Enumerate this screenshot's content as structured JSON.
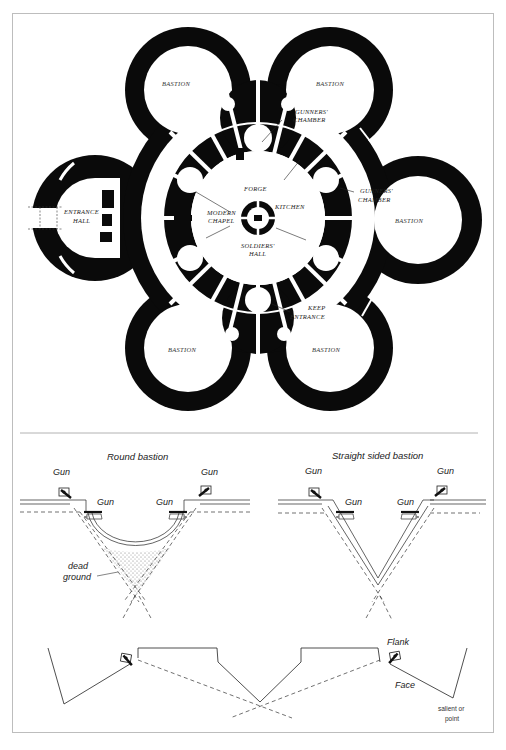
{
  "plan": {
    "labels": {
      "bastion_top_left": "BASTION",
      "bastion_top_right": "BASTION",
      "bastion_right": "BASTION",
      "bastion_bottom_left": "BASTION",
      "bastion_bottom_right": "BASTION",
      "gunners_chamber_top_1": "GUNNERS'",
      "gunners_chamber_top_2": "CHAMBER",
      "gunners_chamber_right_1": "GUNNERS'",
      "gunners_chamber_right_2": "CHAMBER",
      "entrance_hall_1": "ENTRANCE",
      "entrance_hall_2": "HALL",
      "forge": "FORGE",
      "kitchen": "KITCHEN",
      "modern_chapel_1": "MODERN",
      "modern_chapel_2": "CHAPEL",
      "soldiers_hall_1": "SOLDIERS'",
      "soldiers_hall_2": "HALL",
      "keep_entrance_1": "KEEP",
      "keep_entrance_2": "ENTRANCE"
    },
    "colors": {
      "wall": "#0a0a0a",
      "background": "#ffffff"
    }
  },
  "bastion_comparison": {
    "round": {
      "title": "Round bastion",
      "gun_labels": [
        "Gun",
        "Gun",
        "Gun",
        "Gun"
      ],
      "dead_ground_1": "dead",
      "dead_ground_2": "ground"
    },
    "straight": {
      "title": "Straight sided bastion",
      "gun_labels": [
        "Gun",
        "Gun",
        "Gun",
        "Gun"
      ]
    }
  },
  "trace": {
    "flank": "Flank",
    "face": "Face",
    "salient_1": "salient or",
    "salient_2": "point"
  },
  "frame": {
    "color": "#b8b8b8"
  }
}
